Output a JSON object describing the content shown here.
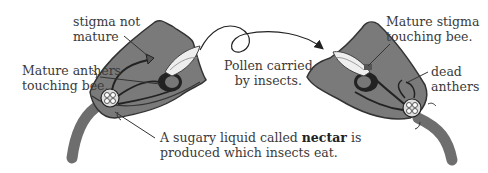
{
  "diagram": {
    "labels": {
      "stigma_not_mature": [
        "stigma not",
        "mature"
      ],
      "mature_anthers": [
        "Mature anthers",
        "touching bee."
      ],
      "pollen_carried": [
        "Pollen carried",
        "by insects."
      ],
      "mature_stigma": [
        "Mature stigma",
        "touching bee."
      ],
      "dead_anthers": [
        "dead",
        "anthers"
      ],
      "nectar": {
        "line1_pre": "A sugary liquid called ",
        "line1_bold": "nectar",
        "line1_post": " is",
        "line2": "produced which insects eat."
      }
    },
    "colors": {
      "flower_fill": "#7a7a7a",
      "flower_outline": "#333333",
      "stem": "#6e6e6e",
      "text": "#3a3a3a",
      "background": "#ffffff"
    }
  }
}
